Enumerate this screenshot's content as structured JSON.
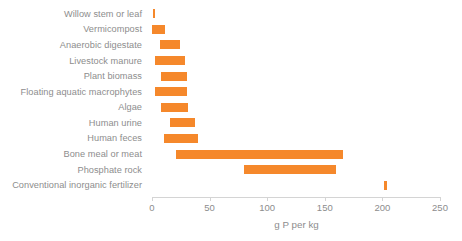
{
  "chart_data": {
    "type": "bar",
    "subtype": "floating-range-bar",
    "title": "",
    "subtitle": "",
    "xlabel": "g P per kg",
    "ylabel": "",
    "xlim": [
      0,
      250
    ],
    "ylim": null,
    "xticks": [
      0,
      50,
      100,
      150,
      200,
      250
    ],
    "xtick_labels": [
      "0",
      "50",
      "100",
      "150",
      "200",
      "250"
    ],
    "grid": false,
    "legend": null,
    "orientation": "horizontal",
    "bar_color": "#f5882b",
    "axis_color": "#d4d4d4",
    "text_color": "#8d8d8d",
    "categories": [
      "Willow stem or leaf",
      "Vermicompost",
      "Anaerobic digestate",
      "Livestock manure",
      "Plant biomass",
      "Floating aquatic macrophytes",
      "Algae",
      "Human urine",
      "Human feces",
      "Bone meal or meat",
      "Phosphate rock",
      "Conventional inorganic fertilizer"
    ],
    "ranges": [
      {
        "category": "Willow stem or leaf",
        "low": 0.5,
        "high": 3
      },
      {
        "category": "Vermicompost",
        "low": 0,
        "high": 11
      },
      {
        "category": "Anaerobic digestate",
        "low": 7,
        "high": 24
      },
      {
        "category": "Livestock manure",
        "low": 3,
        "high": 29
      },
      {
        "category": "Plant biomass",
        "low": 8,
        "high": 30
      },
      {
        "category": "Floating aquatic macrophytes",
        "low": 3,
        "high": 30
      },
      {
        "category": "Algae",
        "low": 8,
        "high": 31
      },
      {
        "category": "Human urine",
        "low": 16,
        "high": 37
      },
      {
        "category": "Human feces",
        "low": 10,
        "high": 40
      },
      {
        "category": "Bone meal or meat",
        "low": 21,
        "high": 166
      },
      {
        "category": "Phosphate rock",
        "low": 80,
        "high": 160
      },
      {
        "category": "Conventional inorganic fertilizer",
        "low": 201,
        "high": 204
      }
    ]
  }
}
